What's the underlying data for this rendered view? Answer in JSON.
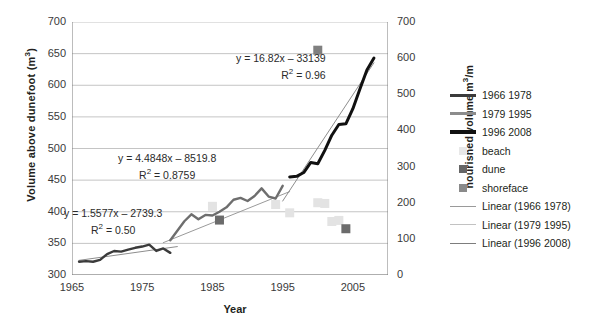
{
  "chart_data": {
    "type": "line",
    "title": "",
    "xlabel": "Year",
    "ylabel": "Volume above dunefoot (m³)",
    "y2label": "nourished volume m³/m",
    "xlim": [
      1965,
      2010
    ],
    "ylim": [
      300,
      700
    ],
    "y2lim": [
      0,
      700
    ],
    "grid": true,
    "legend_position": "right",
    "x_ticks": [
      "1965",
      "1975",
      "1985",
      "1995",
      "2005"
    ],
    "x_tick_values": [
      1965,
      1975,
      1985,
      1995,
      2005
    ],
    "y_ticks": [
      "300",
      "350",
      "400",
      "450",
      "500",
      "550",
      "600",
      "650",
      "700"
    ],
    "y_tick_values": [
      300,
      350,
      400,
      450,
      500,
      550,
      600,
      650,
      700
    ],
    "y2_ticks": [
      "0",
      "100",
      "200",
      "300",
      "400",
      "500",
      "600",
      "700"
    ],
    "y2_tick_values": [
      0,
      100,
      200,
      300,
      400,
      500,
      600,
      700
    ],
    "series": [
      {
        "name": "1966 1978",
        "color": "#3b3b3b",
        "width": 2.4,
        "axis": "left",
        "points": [
          [
            1966,
            321
          ],
          [
            1967,
            322
          ],
          [
            1968,
            321
          ],
          [
            1969,
            324
          ],
          [
            1970,
            333
          ],
          [
            1971,
            338
          ],
          [
            1972,
            337
          ],
          [
            1973,
            340
          ],
          [
            1974,
            343
          ],
          [
            1975,
            345
          ],
          [
            1976,
            348
          ],
          [
            1977,
            338
          ],
          [
            1978,
            342
          ],
          [
            1979,
            335
          ]
        ]
      },
      {
        "name": "1979 1995",
        "color": "#6e6e6e",
        "width": 2.4,
        "axis": "left",
        "points": [
          [
            1979,
            355
          ],
          [
            1980,
            370
          ],
          [
            1981,
            385
          ],
          [
            1982,
            396
          ],
          [
            1983,
            388
          ],
          [
            1984,
            395
          ],
          [
            1985,
            394
          ],
          [
            1986,
            400
          ],
          [
            1987,
            407
          ],
          [
            1988,
            419
          ],
          [
            1989,
            422
          ],
          [
            1990,
            417
          ],
          [
            1991,
            425
          ],
          [
            1992,
            437
          ],
          [
            1993,
            424
          ],
          [
            1994,
            421
          ],
          [
            1995,
            441
          ]
        ]
      },
      {
        "name": "1996 2008",
        "color": "#111111",
        "width": 3.0,
        "axis": "left",
        "points": [
          [
            1996,
            455
          ],
          [
            1997,
            456
          ],
          [
            1998,
            462
          ],
          [
            1999,
            478
          ],
          [
            2000,
            476
          ],
          [
            2001,
            497
          ],
          [
            2002,
            521
          ],
          [
            2003,
            538
          ],
          [
            2004,
            539
          ],
          [
            2005,
            563
          ],
          [
            2006,
            594
          ],
          [
            2007,
            624
          ],
          [
            2008,
            643
          ]
        ]
      }
    ],
    "trendlines": [
      {
        "name": "Linear (1966 1978)",
        "color": "#8d8d8d",
        "width": 1.0,
        "equation": "y = 1.5577x – 2739.3",
        "r2": "R² = 0.50",
        "slope": 1.5577,
        "intercept": -2739.3,
        "x_from": 1966,
        "x_to": 1980
      },
      {
        "name": "Linear (1979 1995)",
        "color": "#9a9a9a",
        "width": 1.0,
        "equation": "y = 4.4848x – 8519.8",
        "r2": "R² = 0.8759",
        "slope": 4.4848,
        "intercept": -8519.8,
        "x_from": 1978,
        "x_to": 1996
      },
      {
        "name": "Linear (1996 2008)",
        "color": "#8d8d8d",
        "width": 1.0,
        "equation": "y = 16.82x – 33139",
        "r2": "R² = 0.96",
        "slope": 16.82,
        "intercept": -33139,
        "x_from": 1995,
        "x_to": 2008
      }
    ],
    "scatter": [
      {
        "name": "beach",
        "color": "#e3e3e3",
        "axis": "right",
        "points": [
          [
            1985,
            190
          ],
          [
            1994,
            195
          ],
          [
            1996,
            172
          ],
          [
            2000,
            200
          ],
          [
            2001,
            198
          ],
          [
            2002,
            148
          ],
          [
            2003,
            151
          ]
        ]
      },
      {
        "name": "dune",
        "color": "#6b6b6b",
        "axis": "right",
        "points": [
          [
            1986,
            152
          ],
          [
            2004,
            128
          ]
        ]
      },
      {
        "name": "shoreface",
        "color": "#808080",
        "axis": "right",
        "points": [
          [
            2000,
            622
          ]
        ]
      }
    ]
  },
  "legend": {
    "items": [
      {
        "label": "1966 1978",
        "kind": "line",
        "color": "#3b3b3b",
        "width": 3
      },
      {
        "label": "1979 1995",
        "kind": "line",
        "color": "#8c8c8c",
        "width": 3
      },
      {
        "label": "1996 2008",
        "kind": "line",
        "color": "#111111",
        "width": 4
      },
      {
        "label": "beach",
        "kind": "square",
        "color": "#e8e8e8"
      },
      {
        "label": "dune",
        "kind": "square",
        "color": "#666666"
      },
      {
        "label": "shoreface",
        "kind": "square",
        "color": "#8a8a8a"
      },
      {
        "label": "Linear (1966 1978)",
        "kind": "line",
        "color": "#9a9a9a",
        "width": 1.4
      },
      {
        "label": "Linear (1979 1995)",
        "kind": "line",
        "color": "#c2c2c2",
        "width": 1.4
      },
      {
        "label": "Linear (1996 2008)",
        "kind": "line",
        "color": "#7d7d7d",
        "width": 1.4
      }
    ]
  },
  "annotations": [
    {
      "id": "eq-1996-2008",
      "equation": "y = 16.82x – 33139",
      "r2_prefix": "R",
      "r2_sup": "2",
      "r2_value": " = 0.96"
    },
    {
      "id": "eq-1979-1995",
      "equation": "y = 4.4848x – 8519.8",
      "r2_prefix": "R",
      "r2_sup": "2",
      "r2_value": " = 0.8759"
    },
    {
      "id": "eq-1966-1978",
      "equation": "y = 1.5577x – 2739.3",
      "r2_prefix": "R",
      "r2_sup": "2",
      "r2_value": " = 0.50"
    }
  ],
  "axis_titles": {
    "left": "Volume above dunefoot (m",
    "left_sup": "3",
    "left_tail": ")",
    "right": "nourished volume m",
    "right_sup": "3",
    "right_tail": "/m",
    "x": "Year"
  }
}
